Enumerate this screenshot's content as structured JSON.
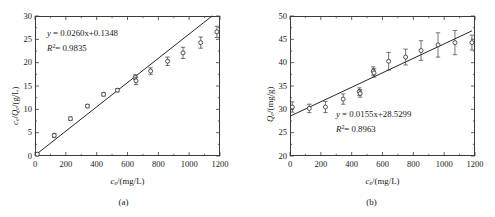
{
  "figure": {
    "panels": [
      {
        "key": "a",
        "sub_caption": "(a)",
        "xlabel_var": "c",
        "xlabel_sub": "e",
        "xlabel_rest": "/(mg/L)",
        "ylabel_html_parts": [
          "c",
          "e",
          "/",
          "Q",
          "e",
          "/(g/L)"
        ],
        "equation": "y = 0.0260x+0.1348",
        "r2_label": "R",
        "r2_sup": "2",
        "r2_value": "= 0.9835",
        "xticks": [
          "0",
          "200",
          "400",
          "600",
          "800",
          "1000",
          "1200"
        ],
        "yticks": [
          "0",
          "5",
          "10",
          "15",
          "20",
          "25",
          "30"
        ]
      },
      {
        "key": "b",
        "sub_caption": "(b)",
        "xlabel_var": "c",
        "xlabel_sub": "e",
        "xlabel_rest": "/(mg/L)",
        "ylabel_html_parts": [
          "Q",
          "e",
          "/(mg/g)"
        ],
        "equation": "y = 0.0155x+28.5299",
        "r2_label": "R",
        "r2_sup": "2",
        "r2_value": "= 0.8963",
        "xticks": [
          "0",
          "200",
          "400",
          "600",
          "800",
          "1000",
          "1200"
        ],
        "yticks": [
          "20",
          "25",
          "30",
          "35",
          "40",
          "45",
          "50"
        ]
      }
    ]
  },
  "chart_data": [
    {
      "type": "scatter",
      "panel": "a",
      "title": "",
      "xlabel": "c_e/(mg/L)",
      "ylabel": "c_e/Q_e/(g/L)",
      "xlim": [
        0,
        1200
      ],
      "ylim": [
        0,
        30
      ],
      "xticks": [
        0,
        200,
        400,
        600,
        800,
        1000,
        1200
      ],
      "yticks": [
        0,
        5,
        10,
        15,
        20,
        25,
        30
      ],
      "grid": false,
      "legend": "none",
      "marker": "open-circle",
      "errorbars": true,
      "x": [
        15,
        125,
        230,
        340,
        445,
        535,
        650,
        655,
        750,
        860,
        960,
        1075,
        1180
      ],
      "y": [
        0.4,
        4.4,
        8.0,
        10.7,
        13.2,
        14.1,
        16.9,
        16.1,
        18.2,
        20.3,
        22.1,
        24.3,
        26.6
      ],
      "yerr": [
        0.3,
        0.45,
        0.35,
        0.35,
        0.35,
        0.35,
        0.5,
        0.8,
        0.7,
        0.9,
        1.2,
        1.2,
        1.2
      ],
      "fit": {
        "type": "line",
        "equation": "y = 0.0260x+0.1348",
        "slope": 0.026,
        "intercept": 0.1348,
        "r2": 0.9835,
        "x_range": [
          0,
          1150
        ]
      }
    },
    {
      "type": "scatter",
      "panel": "b",
      "title": "",
      "xlabel": "c_e/(mg/L)",
      "ylabel": "Q_e/(mg/g)",
      "xlim": [
        0,
        1200
      ],
      "ylim": [
        20,
        50
      ],
      "xticks": [
        0,
        200,
        400,
        600,
        800,
        1000,
        1200
      ],
      "yticks": [
        20,
        25,
        30,
        35,
        40,
        45,
        50
      ],
      "grid": false,
      "legend": "none",
      "marker": "open-circle",
      "errorbars": true,
      "x": [
        15,
        125,
        230,
        345,
        450,
        455,
        540,
        545,
        640,
        750,
        850,
        960,
        1070,
        1180
      ],
      "y": [
        30.5,
        30.2,
        30.5,
        32.2,
        33.8,
        33.4,
        38.2,
        37.8,
        40.3,
        41.2,
        42.6,
        43.8,
        44.3,
        44.3
      ],
      "yerr": [
        1.1,
        0.9,
        1.2,
        1.1,
        0.8,
        0.8,
        0.9,
        0.9,
        1.9,
        1.7,
        2.1,
        2.6,
        2.6,
        1.6
      ],
      "fit": {
        "type": "line",
        "equation": "y = 0.0155x+28.5299",
        "slope": 0.0155,
        "intercept": 28.5299,
        "r2": 0.8963,
        "x_range": [
          0,
          1180
        ]
      }
    }
  ]
}
